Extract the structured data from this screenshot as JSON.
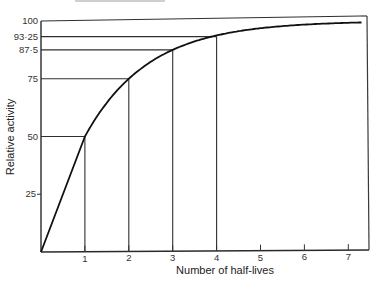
{
  "chart_data": {
    "type": "line",
    "title": "",
    "xlabel": "Number of half-lives",
    "ylabel": "Relative activity",
    "xlim": [
      0,
      7.5
    ],
    "ylim": [
      0,
      100
    ],
    "grid": false,
    "legend": null,
    "x_ticks": [
      "1",
      "2",
      "3",
      "4",
      "5",
      "6",
      "7"
    ],
    "y_ticks": [
      "25",
      "50",
      "75",
      "87·5",
      "93·25",
      "100"
    ],
    "series": [
      {
        "name": "Relative activity",
        "x": [
          0,
          1,
          2,
          3,
          4,
          5,
          6,
          7,
          7.3
        ],
        "values": [
          0,
          50,
          75,
          87.5,
          93.75,
          96.9,
          98.4,
          99.2,
          99.4
        ]
      }
    ],
    "annotations": [
      {
        "x": 1,
        "y": 50,
        "label": "50"
      },
      {
        "x": 2,
        "y": 75,
        "label": "75"
      },
      {
        "x": 3,
        "y": 87.5,
        "label": "87·5"
      },
      {
        "x": 4,
        "y": 93.25,
        "label": "93·25"
      }
    ],
    "y_reference_line": {
      "y": 100,
      "label": "100"
    }
  }
}
